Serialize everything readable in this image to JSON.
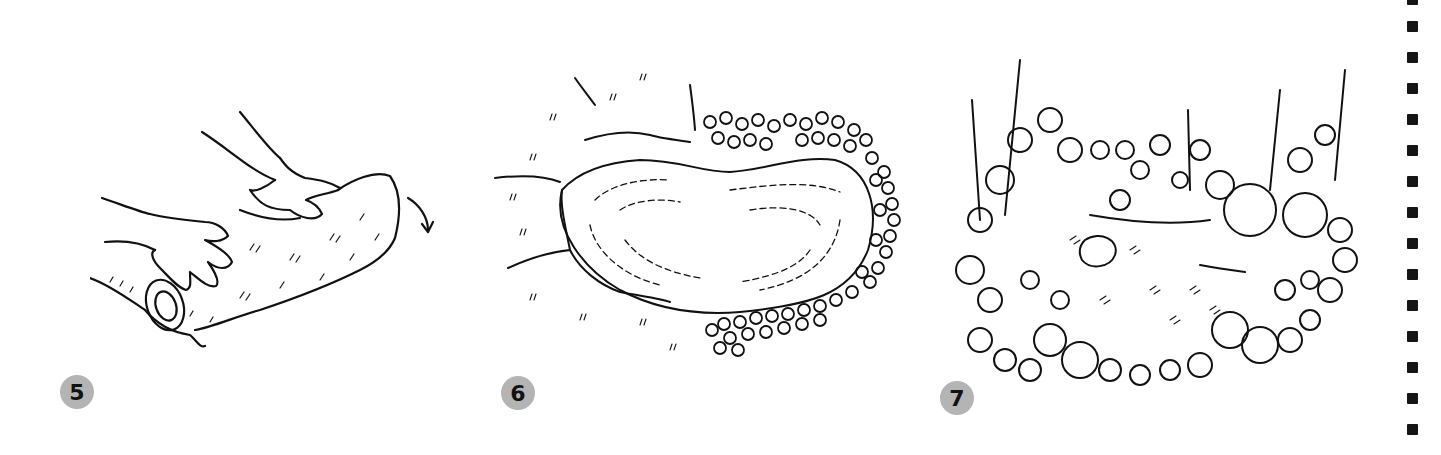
{
  "page": {
    "background": "#ffffff",
    "ink_color": "#111111",
    "badge_color": "#b4b4b4"
  },
  "steps": [
    {
      "number": "5",
      "illustration": "hands-rolling-turf-icon",
      "description": "Gloved hands rolling up a strip of sod/turf, arrow indicating rolling direction"
    },
    {
      "number": "6",
      "illustration": "heart-shaped-pond-with-stones-icon",
      "description": "Heart-shaped pond excavation edged with pebbles/stones on one side"
    },
    {
      "number": "7",
      "illustration": "planted-pond-with-foliage-icon",
      "description": "Finished pond surrounded by dense plants and lily pads"
    }
  ],
  "binding_holes": 15
}
